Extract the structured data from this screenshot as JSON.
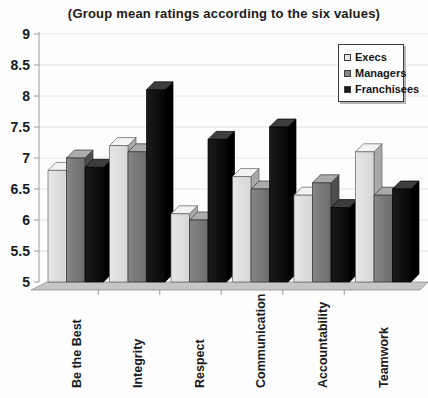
{
  "window": {
    "width": 428,
    "height": 398,
    "background": "#fdfdfd"
  },
  "chart_data": {
    "type": "bar",
    "projection": "3d-columns",
    "title": "(Group mean ratings according to the six values)",
    "categories": [
      "Be the Best",
      "Integrity",
      "Respect",
      "Communication",
      "Accountability",
      "Teamwork"
    ],
    "series": [
      {
        "name": "Execs",
        "values": [
          6.8,
          7.2,
          6.1,
          6.7,
          6.4,
          7.1
        ],
        "front": "#e7e7e7",
        "front2": "#d6d6d6",
        "side": "#a9a9a9",
        "top": "#f3f3f3",
        "border": "#5f5f5f"
      },
      {
        "name": "Managers",
        "values": [
          7.0,
          7.1,
          6.0,
          6.5,
          6.6,
          6.4
        ],
        "front": "#868686",
        "front2": "#6b6b6b",
        "side": "#4d4d4d",
        "top": "#ababab",
        "border": "#333333"
      },
      {
        "name": "Franchisees",
        "values": [
          6.85,
          8.1,
          7.3,
          7.5,
          6.2,
          6.5
        ],
        "front": "#1a1a1a",
        "front2": "#070707",
        "side": "#000000",
        "top": "#3d3d3d",
        "border": "#000000"
      }
    ],
    "ylim": [
      5,
      9
    ],
    "ytick_step": 0.5,
    "ytick_labels": [
      "5",
      "5.5",
      "6",
      "6.5",
      "7",
      "7.5",
      "8",
      "8.5",
      "9"
    ],
    "grid": true,
    "legend_position": "top-right",
    "xlabel": "",
    "ylabel": "",
    "colors": {
      "text": "#1a1a1a",
      "axis": "#9a9a9a",
      "grid": "#e4e4e4",
      "floor": "#c6c6c6",
      "floor_edge": "#8f8f8f"
    }
  }
}
